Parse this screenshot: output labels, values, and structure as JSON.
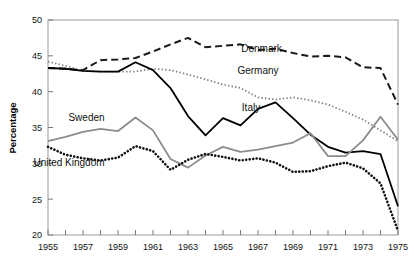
{
  "chart_data": {
    "type": "line",
    "title": "",
    "xlabel": "",
    "ylabel": "Percentage",
    "xlim": [
      1955,
      1975
    ],
    "ylim": [
      20,
      50
    ],
    "yticks": [
      20,
      25,
      30,
      35,
      40,
      45,
      50
    ],
    "ytick_labels": [
      "20",
      "25",
      "30",
      "35",
      "40",
      "45",
      "50"
    ],
    "xticks": [
      1955,
      1956,
      1957,
      1958,
      1959,
      1960,
      1961,
      1962,
      1963,
      1964,
      1965,
      1966,
      1967,
      1968,
      1969,
      1970,
      1971,
      1972,
      1973,
      1974,
      1975
    ],
    "xtick_labels_shown": [
      "1955",
      "1957",
      "1959",
      "1961",
      "1963",
      "1965",
      "1967",
      "1969",
      "1971",
      "1973",
      "1975"
    ],
    "grid": false,
    "legend_position": "inline-annotations",
    "x": [
      1955,
      1956,
      1957,
      1958,
      1959,
      1960,
      1961,
      1962,
      1963,
      1964,
      1965,
      1966,
      1967,
      1968,
      1969,
      1970,
      1971,
      1972,
      1973,
      1974,
      1975
    ],
    "series": [
      {
        "name": "Denmark",
        "color": "#1a1a1a",
        "style": "dashed",
        "label_x": 1967.2,
        "label_y": 45.6,
        "values": [
          43.3,
          43.2,
          43.0,
          44.4,
          44.5,
          44.7,
          45.6,
          46.6,
          47.5,
          46.2,
          46.4,
          46.6,
          45.8,
          46.0,
          45.4,
          44.9,
          45.0,
          44.8,
          43.4,
          43.3,
          38.2
        ]
      },
      {
        "name": "Germany",
        "color": "#808080",
        "style": "dotted",
        "label_x": 1967.0,
        "label_y": 42.4,
        "values": [
          44.2,
          43.6,
          42.9,
          42.8,
          42.8,
          42.8,
          43.2,
          43.0,
          42.4,
          41.7,
          41.0,
          40.5,
          39.2,
          38.9,
          39.2,
          38.8,
          38.2,
          37.2,
          36.1,
          34.6,
          33.1
        ]
      },
      {
        "name": "Italy",
        "color": "#000000",
        "style": "solid",
        "label_x": 1966.6,
        "label_y": 37.3,
        "values": [
          43.3,
          43.2,
          42.9,
          42.8,
          42.8,
          44.1,
          43.0,
          40.5,
          36.6,
          33.9,
          36.3,
          35.3,
          37.6,
          38.5,
          36.3,
          34.0,
          32.3,
          31.5,
          31.7,
          31.3,
          24.0
        ]
      },
      {
        "name": "Sweden",
        "color": "#8c8c8c",
        "style": "solid",
        "label_x": 1957.2,
        "label_y": 35.9,
        "values": [
          33.1,
          33.7,
          34.4,
          34.8,
          34.5,
          36.4,
          34.6,
          30.6,
          29.4,
          31.1,
          32.3,
          31.6,
          31.9,
          32.4,
          32.9,
          34.2,
          31.0,
          31.0,
          33.2,
          36.5,
          33.3
        ]
      },
      {
        "name": "United Kingdom",
        "color": "#111111",
        "style": "dotted-bold",
        "label_x": 1956.2,
        "label_y": 29.6,
        "values": [
          32.3,
          31.2,
          30.7,
          30.4,
          30.8,
          32.4,
          31.7,
          29.1,
          30.5,
          31.3,
          30.9,
          30.4,
          30.7,
          30.1,
          28.8,
          28.9,
          29.6,
          30.1,
          29.3,
          27.2,
          20.6
        ]
      }
    ]
  }
}
